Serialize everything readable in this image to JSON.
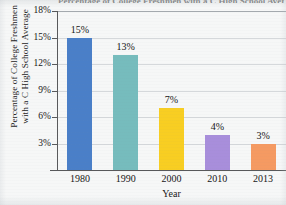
{
  "chart_data": {
    "type": "bar",
    "title": "Percentage of College Freshmen with a C High School Average",
    "xlabel": "Year",
    "ylabel_line1": "Percentage of College Freshmen",
    "ylabel_line2": "with a C High School Average",
    "categories": [
      "1980",
      "1990",
      "2000",
      "2010",
      "2013"
    ],
    "values": [
      15,
      13,
      7,
      4,
      3
    ],
    "value_labels": [
      "15%",
      "13%",
      "7%",
      "4%",
      "3%"
    ],
    "bar_colors": [
      "#4a7fc8",
      "#76bcbd",
      "#f8ce22",
      "#a88edb",
      "#f59a62"
    ],
    "ylim": [
      0,
      18
    ],
    "ytick_values": [
      18,
      15,
      12,
      9,
      6,
      3
    ],
    "ytick_labels": [
      "18%",
      "15%",
      "12%",
      "9%",
      "6%",
      "3%"
    ],
    "grid": true,
    "legend": "none",
    "background_color": "#f6f7f7",
    "axis_color": "#58595b",
    "gridline_color": "#c9cdd1"
  }
}
